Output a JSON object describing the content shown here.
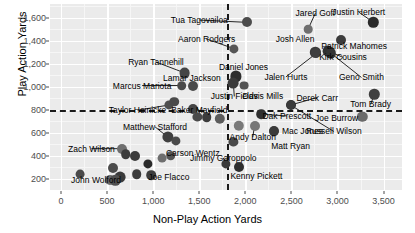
{
  "chart_data": {
    "type": "scatter",
    "title": "",
    "xlabel": "Non-Play Action Yards",
    "ylabel": "Play Action Yards",
    "xlim": [
      -120,
      3700
    ],
    "ylim": [
      100,
      1720
    ],
    "xticks": [
      0,
      500,
      1000,
      1500,
      2000,
      2500,
      3000,
      3500
    ],
    "xticklabels": [
      "0",
      "500",
      "1,000",
      "1,500",
      "2,000",
      "2,500",
      "3,000",
      "3,500"
    ],
    "yticks": [
      200,
      400,
      600,
      800,
      1000,
      1200,
      1400,
      1600
    ],
    "yticklabels": [
      "200",
      "400",
      "600",
      "800",
      "1,000",
      "1,200",
      "1,400",
      "1,600"
    ],
    "grid": true,
    "legend": "none",
    "reference_lines": [
      {
        "orientation": "vertical",
        "value": 1800,
        "style": "dashed",
        "color": "#1a1a1a"
      },
      {
        "orientation": "horizontal",
        "value": 800,
        "style": "dashed",
        "color": "#1a1a1a"
      }
    ],
    "points": [
      {
        "name": "Tua Tagovailoa",
        "x": 2020,
        "y": 1560,
        "r": 5.0,
        "shade": "#4d4d4d",
        "label_x": 1500,
        "label_y": 1580,
        "leader": true
      },
      {
        "name": "Jared Goff",
        "x": 2680,
        "y": 1500,
        "r": 4.3,
        "shade": "#6e6e6e",
        "label_x": 2760,
        "label_y": 1640,
        "leader": true
      },
      {
        "name": "Justin Herbert",
        "x": 3390,
        "y": 1560,
        "r": 5.2,
        "shade": "#2b2b2b",
        "label_x": 3230,
        "label_y": 1650,
        "leader": true
      },
      {
        "name": "Patrick Mahomes",
        "x": 3040,
        "y": 1410,
        "r": 5.0,
        "shade": "#3c3c3c",
        "label_x": 3180,
        "label_y": 1355,
        "leader": false
      },
      {
        "name": "Aaron Rodgers",
        "x": 1880,
        "y": 1330,
        "r": 4.6,
        "shade": "#555555",
        "label_x": 1580,
        "label_y": 1415,
        "leader": true
      },
      {
        "name": "Josh Allen",
        "x": 2760,
        "y": 1300,
        "r": 5.2,
        "shade": "#3a3a3a",
        "label_x": 2540,
        "label_y": 1415,
        "leader": false
      },
      {
        "name": "Kirk Cousins",
        "x": 2900,
        "y": 1310,
        "r": 5.4,
        "shade": "#303030",
        "label_x": 3060,
        "label_y": 1255,
        "leader": true
      },
      {
        "name": "Ryan Tannehill",
        "x": 1340,
        "y": 1120,
        "r": 5.4,
        "shade": "#454545",
        "label_x": 1030,
        "label_y": 1215,
        "leader": true
      },
      {
        "name": "Daniel Jones",
        "x": 1900,
        "y": 1090,
        "r": 5.6,
        "shade": "#2e2e2e",
        "label_x": 1980,
        "label_y": 1175,
        "leader": false
      },
      {
        "name": "Jalen Hurts",
        "x": 2770,
        "y": 1290,
        "r": 5.0,
        "shade": "#3f3f3f",
        "label_x": 2440,
        "label_y": 1085,
        "leader": true
      },
      {
        "name": "Geno Smith",
        "x": 2930,
        "y": 1290,
        "r": 5.2,
        "shade": "#343434",
        "label_x": 3260,
        "label_y": 1080,
        "leader": true
      },
      {
        "name": "Lamar Jackson",
        "x": 1430,
        "y": 1005,
        "r": 5.0,
        "shade": "#4a4a4a",
        "label_x": 1420,
        "label_y": 1075,
        "leader": false
      },
      {
        "name": "Marcus Mariota",
        "x": 1310,
        "y": 1010,
        "r": 4.8,
        "shade": "#4a4a4a",
        "label_x": 880,
        "label_y": 1010,
        "leader": true
      },
      {
        "name": "Justin Fields",
        "x": 1870,
        "y": 1030,
        "r": 5.4,
        "shade": "#3b3b3b",
        "label_x": 1880,
        "label_y": 915,
        "leader": true
      },
      {
        "name": "Davis Mills",
        "x": 1990,
        "y": 1010,
        "r": 4.4,
        "shade": "#525252",
        "label_x": 2190,
        "label_y": 915,
        "leader": false
      },
      {
        "name": "Derek Carr",
        "x": 2490,
        "y": 840,
        "r": 5.0,
        "shade": "#2a2a2a",
        "label_x": 2780,
        "label_y": 905,
        "leader": true
      },
      {
        "name": "Tom Brady",
        "x": 3400,
        "y": 935,
        "r": 5.2,
        "shade": "#3f3f3f",
        "label_x": 3360,
        "label_y": 845,
        "leader": true
      },
      {
        "name": "Taylor Heinicke",
        "x": 1170,
        "y": 840,
        "r": 4.6,
        "shade": "#4e4e4e",
        "label_x": 830,
        "label_y": 795,
        "leader": true
      },
      {
        "name": "Baker Mayfield",
        "x": 1430,
        "y": 805,
        "r": 5.0,
        "shade": "#454545",
        "label_x": 1500,
        "label_y": 795,
        "leader": true
      },
      {
        "name": "Joe Burrow",
        "x": 3270,
        "y": 740,
        "r": 5.2,
        "shade": "#6a6a6a",
        "label_x": 2990,
        "label_y": 730,
        "leader": false
      },
      {
        "name": "Dak Prescott",
        "x": 2170,
        "y": 760,
        "r": 4.8,
        "shade": "#2f2f2f",
        "label_x": 2450,
        "label_y": 745,
        "leader": true
      },
      {
        "name": "Russell Wilson",
        "x": 2490,
        "y": 840,
        "r": 4.6,
        "shade": "#3a3a3a",
        "label_x": 2960,
        "label_y": 610,
        "leader": true
      },
      {
        "name": "Matthew Stafford",
        "x": 1160,
        "y": 560,
        "r": 5.6,
        "shade": "#3f3f3f",
        "label_x": 1020,
        "label_y": 650,
        "leader": true
      },
      {
        "name": "Zach Wilson",
        "x": 660,
        "y": 460,
        "r": 5.0,
        "shade": "#6e6e6e",
        "label_x": 330,
        "label_y": 460,
        "leader": true
      },
      {
        "name": "Carson Wentz",
        "x": 1190,
        "y": 400,
        "r": 4.8,
        "shade": "#555555",
        "label_x": 1430,
        "label_y": 425,
        "leader": false
      },
      {
        "name": "Jimmy Garoppolo",
        "x": 1790,
        "y": 330,
        "r": 4.6,
        "shade": "#3a3a3a",
        "label_x": 1760,
        "label_y": 380,
        "leader": true
      },
      {
        "name": "Andy Dalton",
        "x": 2100,
        "y": 660,
        "r": 5.0,
        "shade": "#777777",
        "label_x": 2080,
        "label_y": 560,
        "leader": true
      },
      {
        "name": "Mac Jones",
        "x": 2310,
        "y": 610,
        "r": 5.0,
        "shade": "#3a3a3a",
        "label_x": 2620,
        "label_y": 610,
        "leader": false
      },
      {
        "name": "Matt Ryan",
        "x": 2310,
        "y": 610,
        "r": 4.6,
        "shade": "#3a3a3a",
        "label_x": 2490,
        "label_y": 480,
        "leader": false
      },
      {
        "name": "Kenny Pickett",
        "x": 1930,
        "y": 300,
        "r": 5.0,
        "shade": "#2e2e2e",
        "label_x": 2120,
        "label_y": 225,
        "leader": false
      },
      {
        "name": "Joe Flacco",
        "x": 980,
        "y": 230,
        "r": 4.8,
        "shade": "#3d3d3d",
        "label_x": 1170,
        "label_y": 210,
        "leader": false
      },
      {
        "name": "John Wolford",
        "x": 210,
        "y": 240,
        "r": 4.4,
        "shade": "#4a4a4a",
        "label_x": 380,
        "label_y": 185,
        "leader": false
      },
      {
        "name": "unlabeled-1",
        "x": 560,
        "y": 290,
        "r": 5.0,
        "shade": "#4b4b4b"
      },
      {
        "name": "unlabeled-2",
        "x": 640,
        "y": 215,
        "r": 5.4,
        "shade": "#3a3a3a"
      },
      {
        "name": "unlabeled-3",
        "x": 530,
        "y": 190,
        "r": 5.0,
        "shade": "#6a6a6a"
      },
      {
        "name": "unlabeled-4",
        "x": 590,
        "y": 185,
        "r": 5.2,
        "shade": "#4f4f4f"
      },
      {
        "name": "unlabeled-5",
        "x": 700,
        "y": 410,
        "r": 4.8,
        "shade": "#3c3c3c"
      },
      {
        "name": "unlabeled-6",
        "x": 800,
        "y": 400,
        "r": 5.0,
        "shade": "#3c3c3c"
      },
      {
        "name": "unlabeled-7",
        "x": 820,
        "y": 240,
        "r": 4.8,
        "shade": "#3d3d3d"
      },
      {
        "name": "unlabeled-8",
        "x": 940,
        "y": 330,
        "r": 4.6,
        "shade": "#2a2a2a"
      },
      {
        "name": "unlabeled-9",
        "x": 1250,
        "y": 530,
        "r": 4.6,
        "shade": "#4a4a4a"
      },
      {
        "name": "unlabeled-10",
        "x": 1100,
        "y": 380,
        "r": 4.4,
        "shade": "#6e6e6e"
      },
      {
        "name": "unlabeled-11",
        "x": 1480,
        "y": 740,
        "r": 4.6,
        "shade": "#4a4a4a"
      },
      {
        "name": "unlabeled-12",
        "x": 1580,
        "y": 735,
        "r": 4.8,
        "shade": "#3c3c3c"
      },
      {
        "name": "unlabeled-13",
        "x": 1720,
        "y": 720,
        "r": 5.2,
        "shade": "#5c5c5c"
      },
      {
        "name": "unlabeled-14",
        "x": 1230,
        "y": 870,
        "r": 4.8,
        "shade": "#4a4a4a"
      },
      {
        "name": "unlabeled-15",
        "x": 1930,
        "y": 660,
        "r": 5.2,
        "shade": "#7a7a7a"
      },
      {
        "name": "unlabeled-16",
        "x": 1870,
        "y": 520,
        "r": 4.6,
        "shade": "#4a4a4a"
      }
    ]
  }
}
